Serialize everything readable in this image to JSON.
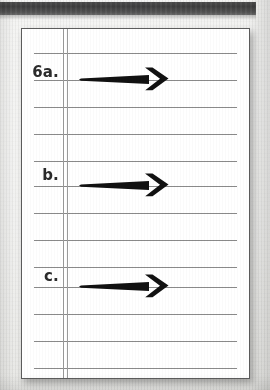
{
  "document": {
    "kind": "ruled-notebook-page-scan",
    "colors": {
      "page": "#ffffff",
      "backdrop": "#eeeeec",
      "rule_line": "#8a8a8a",
      "margin_rule": "#9a9a9a",
      "card_border": "#5d5d5d",
      "ink": "#111111",
      "label_ink": "#2b2b2b",
      "spine_band": "#474747"
    },
    "spine_band": {
      "label": "dark-binding-strip"
    },
    "card": {
      "rule_count": 13,
      "rule_spacing_px": 27,
      "first_rule_y_px": 24,
      "margin_rules_x_px": [
        41,
        45
      ]
    },
    "items": [
      {
        "label": "6a.",
        "label_y": 62,
        "arrow_y": 78,
        "arrow_x": 78,
        "arrow_len": 92
      },
      {
        "label": "b.",
        "label_y": 165,
        "arrow_y": 184,
        "arrow_x": 78,
        "arrow_len": 92
      },
      {
        "label": "c.",
        "label_y": 266,
        "arrow_y": 285,
        "arrow_x": 78,
        "arrow_len": 92
      }
    ],
    "arrow": {
      "name": "rightward-arrow",
      "direction": "right",
      "style": "bold-tapered-shaft-with-chevron-head"
    }
  }
}
